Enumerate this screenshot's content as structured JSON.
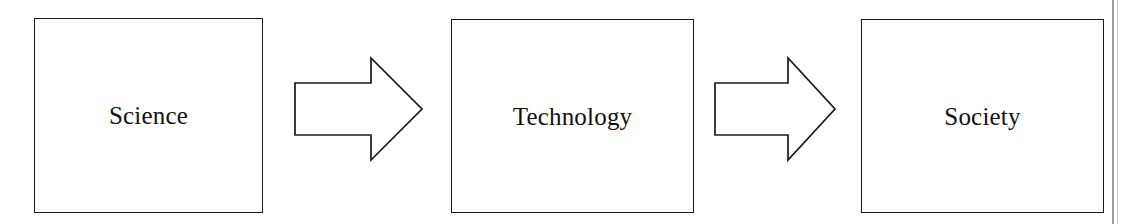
{
  "diagram": {
    "type": "flowchart",
    "orientation": "left-to-right",
    "background_color": "#ffffff",
    "stroke_color": "#1a1a1a",
    "text_color": "#111111",
    "nodes": [
      {
        "id": "science",
        "label": "Science",
        "shape": "rectangle",
        "x": 34,
        "y": 18,
        "width": 229,
        "height": 195
      },
      {
        "id": "technology",
        "label": "Technology",
        "shape": "rectangle",
        "x": 451,
        "y": 19,
        "width": 243,
        "height": 194
      },
      {
        "id": "society",
        "label": "Society",
        "shape": "rectangle",
        "x": 861,
        "y": 19,
        "width": 243,
        "height": 194
      }
    ],
    "connectors": [
      {
        "id": "science-to-technology",
        "label": "",
        "shape": "block-arrow",
        "direction": "right",
        "from": "science",
        "to": "technology",
        "x": 294,
        "y": 57,
        "width": 129,
        "height": 104
      },
      {
        "id": "technology-to-society",
        "label": "",
        "shape": "block-arrow",
        "direction": "right",
        "from": "technology",
        "to": "society",
        "x": 714,
        "y": 57,
        "width": 122,
        "height": 104
      }
    ],
    "artifacts": [
      {
        "id": "page-edge",
        "kind": "scan-edge-line",
        "color": "#9a9a9a",
        "x": 1112,
        "y": 0,
        "width": 2,
        "height": 224
      },
      {
        "id": "page-edge-soft",
        "kind": "scan-edge-line",
        "color": "#c9c9c9",
        "x": 1117,
        "y": 0,
        "width": 1,
        "height": 224
      }
    ]
  }
}
